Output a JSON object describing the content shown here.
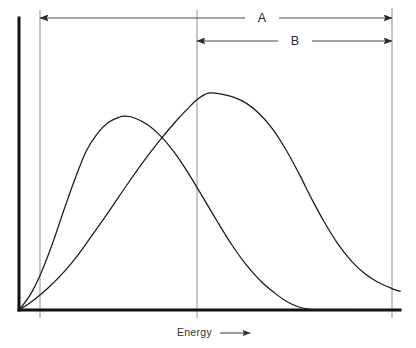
{
  "figure": {
    "background_color": "#ffffff",
    "width": 416,
    "height": 348,
    "axis_color": "#111111",
    "guide_color": "#9a9a9a",
    "curve_color": "#1a1a1a",
    "dimension_color": "#4a4a4a"
  },
  "axes": {
    "x_caption": "Energy",
    "x_caption_arrow": "⟶",
    "y_caption": "",
    "origin_x": 19,
    "origin_y": 310,
    "x_axis_end": 400,
    "y_axis_top": 18,
    "tick_labels_x": [],
    "tick_labels_y": []
  },
  "guide_lines": [
    {
      "name": "left-threshold",
      "x": 40,
      "y_top": 10,
      "y_bottom": 318
    },
    {
      "name": "middle-threshold",
      "x": 197,
      "y_top": 10,
      "y_bottom": 318
    },
    {
      "name": "right-threshold",
      "x": 392,
      "y_top": 8,
      "y_bottom": 318
    }
  ],
  "dimensions": [
    {
      "label": "A",
      "y": 18,
      "x_start": 40,
      "x_end": 392,
      "label_x": 262,
      "arrow_left": true,
      "arrow_right": true
    },
    {
      "label": "B",
      "y": 41,
      "x_start": 197,
      "x_end": 392,
      "label_x": 295,
      "arrow_left": true,
      "arrow_right": true
    }
  ],
  "chart_data": {
    "type": "line",
    "title": "",
    "subtitle": "",
    "xlabel": "Energy",
    "ylabel": "",
    "xlim": [
      0,
      1
    ],
    "ylim": [
      0,
      1
    ],
    "grid": false,
    "legend": null,
    "annotations": [
      {
        "text": "A",
        "description": "full-range span bracket across upper region"
      },
      {
        "text": "B",
        "description": "partial-range span bracket across right region"
      },
      {
        "text": "Energy",
        "description": "x-axis caption with rightward arrow"
      }
    ],
    "series": [
      {
        "name": "curve-1",
        "description": "narrow distribution, earlier peak, decays to baseline before right edge",
        "peak_x": 0.284,
        "peak_y": 0.769,
        "points": [
          [
            0.0,
            0.0
          ],
          [
            0.03,
            0.06
          ],
          [
            0.06,
            0.15
          ],
          [
            0.09,
            0.265
          ],
          [
            0.12,
            0.395
          ],
          [
            0.15,
            0.52
          ],
          [
            0.18,
            0.63
          ],
          [
            0.21,
            0.7
          ],
          [
            0.24,
            0.745
          ],
          [
            0.27,
            0.766
          ],
          [
            0.284,
            0.769
          ],
          [
            0.31,
            0.762
          ],
          [
            0.345,
            0.735
          ],
          [
            0.38,
            0.69
          ],
          [
            0.415,
            0.628
          ],
          [
            0.45,
            0.552
          ],
          [
            0.49,
            0.455
          ],
          [
            0.53,
            0.355
          ],
          [
            0.57,
            0.26
          ],
          [
            0.61,
            0.178
          ],
          [
            0.65,
            0.112
          ],
          [
            0.69,
            0.062
          ],
          [
            0.72,
            0.032
          ],
          [
            0.75,
            0.012
          ],
          [
            0.78,
            0.003
          ],
          [
            0.8,
            0.0
          ],
          [
            1.0,
            0.0
          ]
        ]
      },
      {
        "name": "curve-2",
        "description": "broad distribution, later and higher peak, long right tail persisting past right edge",
        "peak_x": 0.507,
        "peak_y": 0.861,
        "points": [
          [
            0.0,
            0.0
          ],
          [
            0.04,
            0.04
          ],
          [
            0.08,
            0.09
          ],
          [
            0.12,
            0.15
          ],
          [
            0.16,
            0.222
          ],
          [
            0.2,
            0.305
          ],
          [
            0.245,
            0.4
          ],
          [
            0.29,
            0.498
          ],
          [
            0.335,
            0.592
          ],
          [
            0.38,
            0.678
          ],
          [
            0.42,
            0.748
          ],
          [
            0.455,
            0.803
          ],
          [
            0.48,
            0.838
          ],
          [
            0.507,
            0.861
          ],
          [
            0.54,
            0.858
          ],
          [
            0.575,
            0.845
          ],
          [
            0.61,
            0.82
          ],
          [
            0.645,
            0.778
          ],
          [
            0.68,
            0.718
          ],
          [
            0.715,
            0.638
          ],
          [
            0.75,
            0.543
          ],
          [
            0.785,
            0.44
          ],
          [
            0.82,
            0.345
          ],
          [
            0.855,
            0.262
          ],
          [
            0.89,
            0.196
          ],
          [
            0.925,
            0.147
          ],
          [
            0.96,
            0.112
          ],
          [
            1.0,
            0.085
          ],
          [
            1.022,
            0.074
          ]
        ]
      }
    ]
  }
}
